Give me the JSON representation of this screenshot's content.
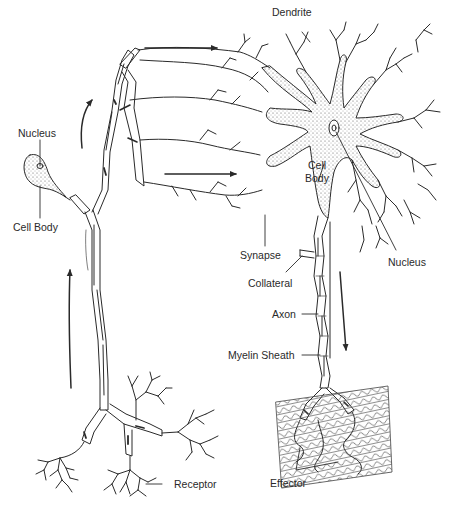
{
  "diagram": {
    "type": "biology-illustration",
    "colors": {
      "line": "#2a2a2a",
      "stipple": "#555555",
      "background": "#ffffff"
    },
    "labels": {
      "dendrite": "Dendrite",
      "nucleus_left": "Nucleus",
      "cell_body_left": "Cell Body",
      "cell_body_right_line1": "Cell",
      "cell_body_right_line2": "Body",
      "nucleus_right": "Nucleus",
      "synapse": "Synapse",
      "collateral": "Collateral",
      "axon": "Axon",
      "myelin_sheath": "Myelin Sheath",
      "receptor": "Receptor",
      "effector": "Effector"
    },
    "arrows": [
      {
        "name": "arrow-up-sensory-lower",
        "direction": "up"
      },
      {
        "name": "arrow-up-sensory-upper",
        "direction": "up-right"
      },
      {
        "name": "arrow-right-top",
        "direction": "right"
      },
      {
        "name": "arrow-right-middle",
        "direction": "right"
      },
      {
        "name": "arrow-down-motor",
        "direction": "down"
      }
    ]
  }
}
